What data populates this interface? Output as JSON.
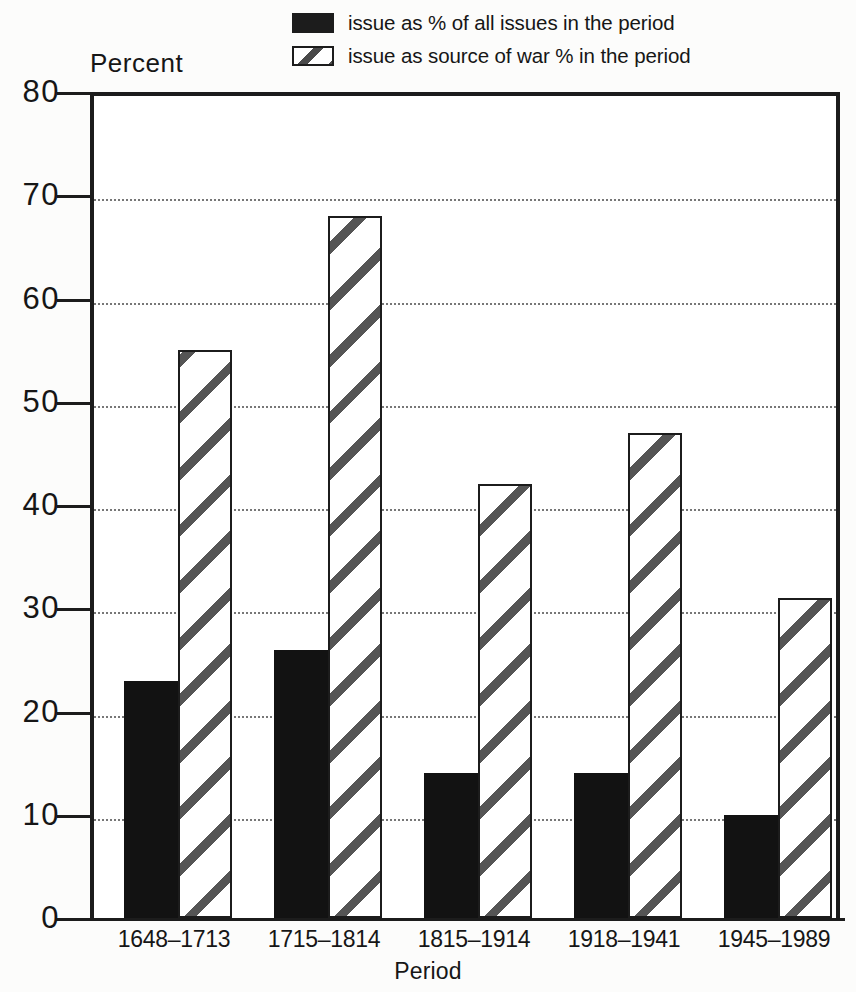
{
  "chart_data": {
    "type": "bar",
    "title": "",
    "ylabel": "Percent",
    "xlabel": "Period",
    "ylim": [
      0,
      80
    ],
    "yticks": [
      0,
      10,
      20,
      30,
      40,
      50,
      60,
      70,
      80
    ],
    "grid": true,
    "legend_position": "top-right",
    "categories": [
      "1648–1713",
      "1715–1814",
      "1815–1914",
      "1918–1941",
      "1945–1989"
    ],
    "series": [
      {
        "name": "issue as % of all issues in the period",
        "style": "solid-black",
        "color": "#121212",
        "values": [
          23,
          26,
          14,
          14,
          10
        ]
      },
      {
        "name": "issue as source of war % in the period",
        "style": "diagonal-hatch",
        "color": "#ffffff",
        "values": [
          55,
          68,
          42,
          47,
          31
        ]
      }
    ]
  },
  "legend": {
    "items": [
      {
        "label": "issue as % of all issues in the period",
        "swatch": "solid-black-swatch"
      },
      {
        "label": "issue as source of war % in the period",
        "swatch": "diagonal-hatch-swatch"
      }
    ]
  },
  "axes": {
    "y_title": "Percent",
    "x_title": "Period",
    "y_tick_labels": [
      "80",
      "70",
      "60",
      "50",
      "40",
      "30",
      "20",
      "10",
      "0"
    ],
    "x_tick_labels": [
      "1648–1713",
      "1715–1814",
      "1815–1914",
      "1918–1941",
      "1945–1989"
    ]
  },
  "colors": {
    "solid_bar": "#121212",
    "hatch_line": "#555555",
    "axis": "#1c1c1c",
    "gridline": "#777777",
    "background": "#ffffff"
  }
}
